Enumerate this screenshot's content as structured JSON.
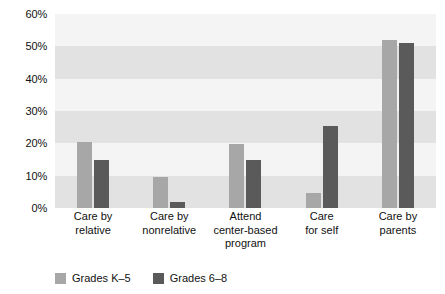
{
  "chart_data": {
    "type": "bar",
    "title": "",
    "subtitle": "",
    "xlabel": "",
    "ylabel": "",
    "ylim": [
      0,
      60
    ],
    "ytick_step": 10,
    "ytick_labels": [
      "60%",
      "50%",
      "40%",
      "30%",
      "20%",
      "10%",
      "0%"
    ],
    "ytick_values": [
      60,
      50,
      40,
      30,
      20,
      10,
      0
    ],
    "grid": false,
    "banded_background": true,
    "legend_position": "bottom-left",
    "categories": [
      "Care by relative",
      "Care by nonrelative",
      "Attend center-based program",
      "Care for self",
      "Care by parents"
    ],
    "category_lines": [
      [
        "Care by",
        "relative"
      ],
      [
        "Care by",
        "nonrelative"
      ],
      [
        "Attend",
        "center-based",
        "program"
      ],
      [
        "Care",
        "for self"
      ],
      [
        "Care by",
        "parents"
      ]
    ],
    "series": [
      {
        "name": "Grades K–5",
        "color": "#a7a7a7",
        "values": [
          20.5,
          9.7,
          19.7,
          4.5,
          52.0
        ]
      },
      {
        "name": "Grades 6–8",
        "color": "#5a5a5a",
        "values": [
          15.0,
          1.8,
          15.0,
          25.3,
          51.0
        ]
      }
    ]
  },
  "legend": {
    "items": [
      {
        "label": "Grades K–5",
        "swatch": "legend-swatch-light"
      },
      {
        "label": "Grades 6–8",
        "swatch": "legend-swatch-dark"
      }
    ]
  },
  "colors": {
    "series_light": "#a7a7a7",
    "series_dark": "#5a5a5a",
    "plot_background": "#f2f2f2",
    "band_dark": "#e2e2e2",
    "band_light": "#f4f4f4",
    "text": "#111111"
  }
}
